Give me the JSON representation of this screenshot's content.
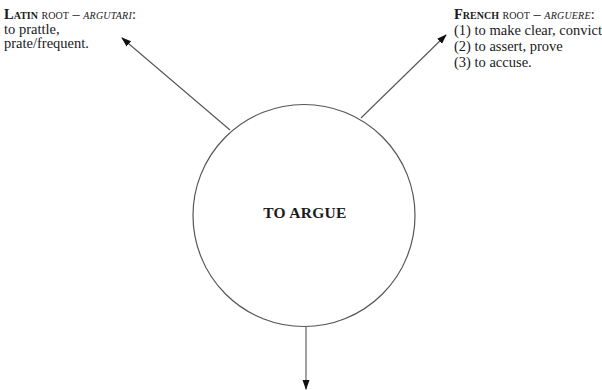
{
  "diagram": {
    "center": {
      "label": "TO ARGUE"
    },
    "latin": {
      "lang": "Latin",
      "root_word": "root",
      "dash": " – ",
      "etymon": "argutari",
      "colon": ":",
      "lines": [
        "to prattle,",
        "prate/frequent."
      ]
    },
    "french": {
      "lang": "French",
      "root_word": "root",
      "dash": " – ",
      "etymon": "arguere",
      "colon": ":",
      "lines": [
        "(1) to make clear, convict",
        "(2) to assert, prove",
        "(3) to accuse."
      ]
    },
    "colors": {
      "stroke": "#555555",
      "text": "#1a1a1a",
      "arrowhead": "#111111",
      "background": "#ffffff"
    }
  }
}
